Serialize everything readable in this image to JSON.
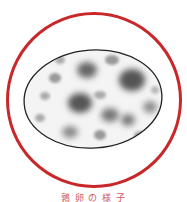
{
  "illustration": {
    "subject": "speckled-egg",
    "ring_color": "#c8282a",
    "egg_base_color": "#f2f2f2",
    "egg_outline_color": "#222222",
    "spot_color": "#6e6e6e"
  },
  "caption": {
    "text": "鶉 卵 の 様 子"
  }
}
